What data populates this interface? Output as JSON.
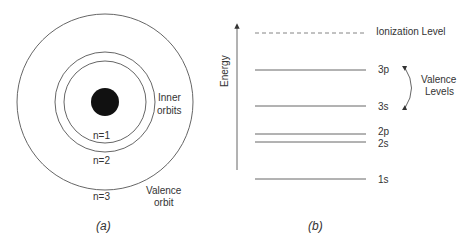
{
  "panel_a": {
    "caption": "(a)",
    "orbit_labels": [
      "n=1",
      "n=2",
      "n=3"
    ],
    "inner_label_line1": "Inner",
    "inner_label_line2": "orbits",
    "valence_label_line1": "Valence",
    "valence_label_line2": "orbit"
  },
  "panel_b": {
    "caption": "(b)",
    "axis_label": "Energy",
    "levels": [
      {
        "name": "Ionization Level",
        "style": "dashed"
      },
      {
        "name": "3p",
        "style": "solid"
      },
      {
        "name": "3s",
        "style": "solid"
      },
      {
        "name": "2p",
        "style": "solid"
      },
      {
        "name": "2s",
        "style": "solid"
      },
      {
        "name": "1s",
        "style": "solid"
      }
    ],
    "valence_label_line1": "Valence",
    "valence_label_line2": "Levels"
  },
  "colors": {
    "line": "#555555",
    "text": "#333333",
    "nucleus": "#111111"
  }
}
